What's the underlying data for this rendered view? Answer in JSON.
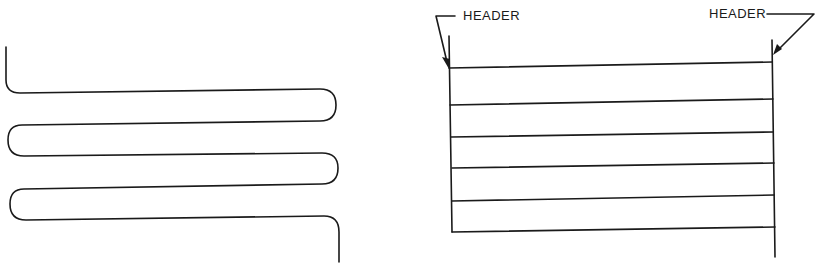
{
  "diagrams": [
    {
      "name": "serpentine-coil",
      "passes": 5,
      "stroke_color": "#1a1a1a"
    },
    {
      "name": "header-grid",
      "tubes": 6,
      "stroke_color": "#1a1a1a",
      "labels": {
        "left_header": "HEADER",
        "right_header": "HEADER"
      }
    }
  ]
}
